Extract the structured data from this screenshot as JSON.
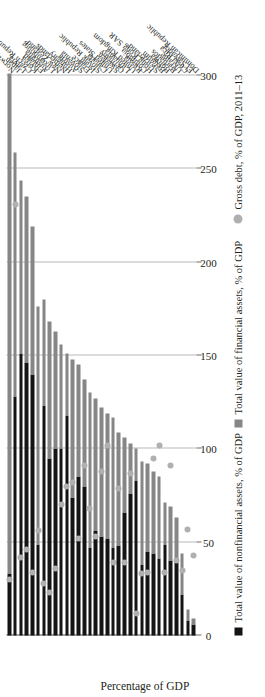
{
  "chart_data": {
    "type": "bar",
    "subtype": "stacked-horizontal",
    "title": "",
    "xlabel": "",
    "ylabel": "Percentage of GDP",
    "value_axis_title": "Percentage of GDP",
    "ylim": [
      0,
      300
    ],
    "ticks": [
      0,
      50,
      100,
      150,
      200,
      250,
      300
    ],
    "grid": true,
    "legend_position": "bottom",
    "legend": [
      {
        "label": "Total value of nonfinancial assets, % of GDP",
        "marker": "square",
        "color": "#141414"
      },
      {
        "label": "Total value of financial assets, % of GDP",
        "marker": "square",
        "color": "#868686"
      },
      {
        "label": "Gross debt, % of GDP, 2011–13",
        "marker": "circle",
        "color": "#b0b0b0"
      }
    ],
    "categories": [
      "Norway",
      "Japan",
      "Latvia",
      "Czech Republic",
      "Korea",
      "Finland",
      "Australia",
      "Luxembourg",
      "New Zealand",
      "Netherlands",
      "Hungary",
      "Austria",
      "Slovenia",
      "France",
      "Israel",
      "Slovak Republic",
      "Canada",
      "United States",
      "Sweden",
      "Germany",
      "Lithuania",
      "United Kingdom",
      "Russia",
      "Columbia",
      "Hong Kong SAR",
      "Switzerland",
      "Belgium",
      "Bolivia",
      "Barbados",
      "Ukraine",
      "Costa Rica",
      "El Salvador",
      "Dominican Republic"
    ],
    "series": [
      {
        "name": "Total value of nonfinancial assets, % of GDP",
        "color": "#141414",
        "values": [
          33,
          128,
          151,
          146,
          140,
          49,
          123,
          95,
          100,
          100,
          118,
          74,
          85,
          80,
          47,
          56,
          53,
          52,
          47,
          48,
          66,
          76,
          83,
          38,
          45,
          44,
          41,
          49,
          40,
          40,
          22,
          8,
          6
        ]
      },
      {
        "name": "Total value of financial assets, % of GDP",
        "color": "#868686",
        "values": [
          268,
          131,
          93,
          89,
          79,
          127,
          57,
          73,
          63,
          56,
          33,
          74,
          60,
          57,
          83,
          71,
          69,
          67,
          70,
          61,
          40,
          27,
          17,
          55,
          47,
          44,
          44,
          22,
          29,
          23,
          22,
          6,
          3
        ]
      }
    ],
    "gross_debt": {
      "name": "Gross debt, % of GDP, 2011–13",
      "color": "#b0b0b0",
      "values": [
        30,
        231,
        42,
        46,
        34,
        56,
        28,
        23,
        36,
        70,
        80,
        82,
        52,
        91,
        68,
        53,
        88,
        102,
        39,
        79,
        39,
        87,
        12,
        33,
        34,
        95,
        102,
        34,
        91,
        40,
        35,
        57,
        43
      ]
    }
  }
}
